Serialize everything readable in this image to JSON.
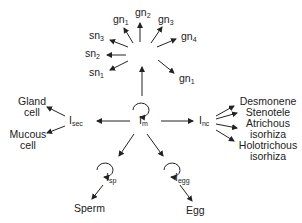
{
  "diagram": {
    "type": "cell lineage diagram",
    "nodes": {
      "im": {
        "base": "I",
        "sub": "m"
      },
      "isec": {
        "base": "I",
        "sub": "sec"
      },
      "inc": {
        "base": "I",
        "sub": "nc"
      },
      "isp": {
        "base": "I",
        "sub": "sp"
      },
      "iegg": {
        "base": "I",
        "sub": "egg"
      }
    },
    "neurons": [
      {
        "base": "gn",
        "sub": "1"
      },
      {
        "base": "gn",
        "sub": "2"
      },
      {
        "base": "gn",
        "sub": "3"
      },
      {
        "base": "gn",
        "sub": "4"
      },
      {
        "base": "gn",
        "sub": "1"
      },
      {
        "base": "sn",
        "sub": "3"
      },
      {
        "base": "sn",
        "sub": "2"
      },
      {
        "base": "sn",
        "sub": "1"
      }
    ],
    "secretory": {
      "gland": "Gland\ncell",
      "gland_line1": "Gland",
      "gland_line2": "cell",
      "mucous_line1": "Mucous",
      "mucous_line2": "cell"
    },
    "nematocytes": {
      "items": [
        "Desmonene",
        "Stenotele",
        "Atrichous",
        "isorhiza",
        "Holotrichous",
        "isorhiza"
      ]
    },
    "gametes": {
      "sperm": "Sperm",
      "egg": "Egg"
    },
    "self_renewal_icons": [
      "im",
      "isp",
      "iegg"
    ]
  }
}
